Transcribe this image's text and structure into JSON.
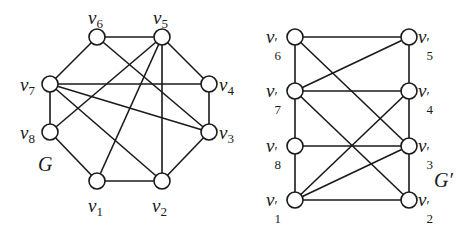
{
  "graphs": [
    {
      "name": "G",
      "name_pos": [
        38,
        85
      ],
      "nodes": [
        {
          "id": "v1",
          "base": "v",
          "sub": "1",
          "prime": "",
          "x": 97,
          "y": 181,
          "lx": 88,
          "ly": 196
        },
        {
          "id": "v2",
          "base": "v",
          "sub": "2",
          "prime": "",
          "x": 162,
          "y": 181,
          "lx": 152,
          "ly": 196
        },
        {
          "id": "v3",
          "base": "v",
          "sub": "3",
          "prime": "",
          "x": 209,
          "y": 132,
          "lx": 219,
          "ly": 123
        },
        {
          "id": "v4",
          "base": "v",
          "sub": "4",
          "prime": "",
          "x": 209,
          "y": 84,
          "lx": 219,
          "ly": 75
        },
        {
          "id": "v5",
          "base": "v",
          "sub": "5",
          "prime": "",
          "x": 162,
          "y": 37,
          "lx": 153,
          "ly": 8
        },
        {
          "id": "v6",
          "base": "v",
          "sub": "6",
          "prime": "",
          "x": 97,
          "y": 37,
          "lx": 88,
          "ly": 8
        },
        {
          "id": "v7",
          "base": "v",
          "sub": "7",
          "prime": "",
          "x": 50,
          "y": 84,
          "lx": 20,
          "ly": 75
        },
        {
          "id": "v8",
          "base": "v",
          "sub": "8",
          "prime": "",
          "x": 50,
          "y": 132,
          "lx": 20,
          "ly": 123
        }
      ],
      "edges": [
        [
          "v6",
          "v5"
        ],
        [
          "v6",
          "v7"
        ],
        [
          "v5",
          "v4"
        ],
        [
          "v7",
          "v4"
        ],
        [
          "v7",
          "v8"
        ],
        [
          "v4",
          "v3"
        ],
        [
          "v8",
          "v1"
        ],
        [
          "v1",
          "v2"
        ],
        [
          "v2",
          "v3"
        ],
        [
          "v5",
          "v8"
        ],
        [
          "v5",
          "v1"
        ],
        [
          "v5",
          "v2"
        ],
        [
          "v6",
          "v3"
        ],
        [
          "v7",
          "v2"
        ],
        [
          "v7",
          "v3"
        ]
      ]
    },
    {
      "name": "G′",
      "name_pos": [
        434,
        170
      ],
      "nodes": [
        {
          "id": "v1p",
          "base": "v",
          "sub": "1",
          "prime": "′",
          "x": 295,
          "y": 200,
          "lx": 266,
          "ly": 190
        },
        {
          "id": "v2p",
          "base": "v",
          "sub": "2",
          "prime": "′",
          "x": 409,
          "y": 200,
          "lx": 418,
          "ly": 190
        },
        {
          "id": "v3p",
          "base": "v",
          "sub": "3",
          "prime": "′",
          "x": 409,
          "y": 146,
          "lx": 418,
          "ly": 136
        },
        {
          "id": "v4p",
          "base": "v",
          "sub": "4",
          "prime": "′",
          "x": 409,
          "y": 91,
          "lx": 418,
          "ly": 81
        },
        {
          "id": "v5p",
          "base": "v",
          "sub": "5",
          "prime": "′",
          "x": 409,
          "y": 37,
          "lx": 418,
          "ly": 27
        },
        {
          "id": "v6p",
          "base": "v",
          "sub": "6",
          "prime": "′",
          "x": 295,
          "y": 37,
          "lx": 266,
          "ly": 27
        },
        {
          "id": "v7p",
          "base": "v",
          "sub": "7",
          "prime": "′",
          "x": 295,
          "y": 91,
          "lx": 266,
          "ly": 81
        },
        {
          "id": "v8p",
          "base": "v",
          "sub": "8",
          "prime": "′",
          "x": 295,
          "y": 146,
          "lx": 266,
          "ly": 136
        }
      ],
      "edges": [
        [
          "v6p",
          "v5p"
        ],
        [
          "v6p",
          "v7p"
        ],
        [
          "v5p",
          "v4p"
        ],
        [
          "v7p",
          "v4p"
        ],
        [
          "v7p",
          "v8p"
        ],
        [
          "v4p",
          "v3p"
        ],
        [
          "v8p",
          "v3p"
        ],
        [
          "v8p",
          "v1p"
        ],
        [
          "v3p",
          "v2p"
        ],
        [
          "v1p",
          "v2p"
        ],
        [
          "v7p",
          "v5p"
        ],
        [
          "v6p",
          "v3p"
        ],
        [
          "v7p",
          "v2p"
        ],
        [
          "v1p",
          "v4p"
        ],
        [
          "v1p",
          "v3p"
        ]
      ]
    }
  ],
  "style": {
    "stroke": "#1a1a1a",
    "node_fill": "#ffffff",
    "node_radius": 8
  }
}
